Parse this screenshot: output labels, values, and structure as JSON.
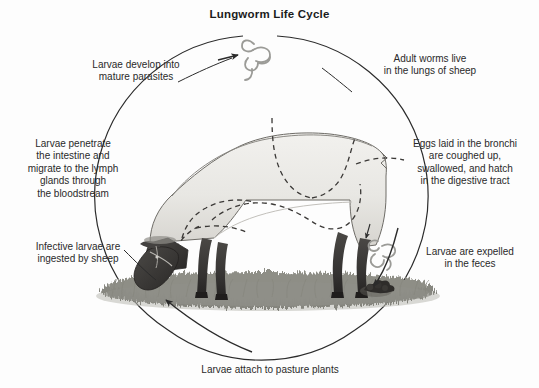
{
  "diagram": {
    "title": "Lungworm Life Cycle",
    "background_color": "#fdfdfd",
    "text_color": "#2a2a2a",
    "line_color": "#2b2b2b"
  },
  "labels": {
    "top_left": "Larvae develop into\nmature parasites",
    "top_right": "Adult worms live\nin the lungs of sheep",
    "right": "Eggs laid in the bronchi\nare coughed up,\nswallowed, and hatch\nin the digestive tract",
    "left": "Larvae penetrate\nthe intestine and\nmigrate to the lymph\nglands through\nthe bloodstream",
    "bottom_left": "Infective larvae are\ningested by sheep",
    "bottom_right": "Larvae are expelled\nin the feces",
    "bottom": "Larvae attach to pasture plants"
  },
  "icons": {
    "worm_top": "worm-icon",
    "worm_right": "worm-icon",
    "feces": "feces-clump-icon",
    "sheep": "grazing-sheep-icon",
    "grass": "pasture-grass-icon"
  }
}
